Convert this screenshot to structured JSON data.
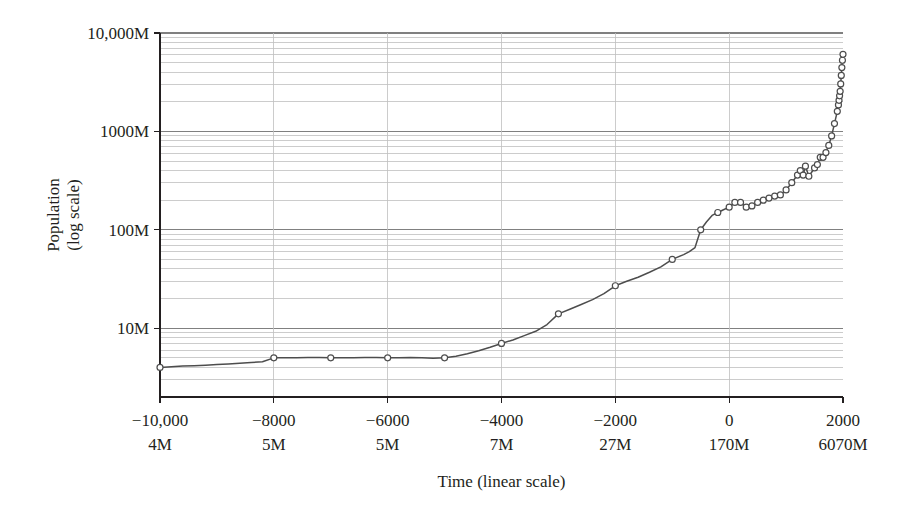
{
  "chart_data": {
    "type": "line",
    "title": "",
    "xlabel": "Time (linear scale)",
    "ylabel_line1": "Population",
    "ylabel_line2": "(log scale)",
    "xlim": [
      -10000,
      2000
    ],
    "ylim": [
      2000000,
      10000000000
    ],
    "yscale": "log",
    "xscale": "linear",
    "grid": true,
    "legend": "none",
    "y_major_ticks": [
      {
        "value": 10000000000,
        "label": "10,000M"
      },
      {
        "value": 1000000000,
        "label": "1000M"
      },
      {
        "value": 100000000,
        "label": "100M"
      },
      {
        "value": 10000000,
        "label": "10M"
      }
    ],
    "y_minor_multipliers": [
      2,
      3,
      4,
      5,
      6,
      7,
      8,
      9
    ],
    "x_major_ticks": [
      {
        "value": -10000,
        "label": "−10,000",
        "population_label": "4M"
      },
      {
        "value": -8000,
        "label": "−8000",
        "population_label": "5M"
      },
      {
        "value": -6000,
        "label": "−6000",
        "population_label": "5M"
      },
      {
        "value": -4000,
        "label": "−4000",
        "population_label": "7M"
      },
      {
        "value": -2000,
        "label": "−2000",
        "population_label": "27M"
      },
      {
        "value": 0,
        "label": "0",
        "population_label": "170M"
      },
      {
        "value": 2000,
        "label": "2000",
        "population_label": "6070M"
      }
    ],
    "series": [
      {
        "name": "World population",
        "marker": "circle",
        "line_color": "#4d4d4d",
        "marker_edge_color": "#4d4d4d",
        "marker_face_color": "#ffffff",
        "points": [
          {
            "x": -10000,
            "y": 4000000,
            "marker": true
          },
          {
            "x": -9800,
            "y": 4060000,
            "marker": false
          },
          {
            "x": -9600,
            "y": 4120000,
            "marker": false
          },
          {
            "x": -9400,
            "y": 4160000,
            "marker": false
          },
          {
            "x": -9200,
            "y": 4210000,
            "marker": false
          },
          {
            "x": -9000,
            "y": 4280000,
            "marker": false
          },
          {
            "x": -8800,
            "y": 4340000,
            "marker": false
          },
          {
            "x": -8600,
            "y": 4400000,
            "marker": false
          },
          {
            "x": -8400,
            "y": 4480000,
            "marker": false
          },
          {
            "x": -8200,
            "y": 4560000,
            "marker": false
          },
          {
            "x": -8000,
            "y": 5000000,
            "marker": true
          },
          {
            "x": -7800,
            "y": 5010000,
            "marker": false
          },
          {
            "x": -7600,
            "y": 5020000,
            "marker": false
          },
          {
            "x": -7400,
            "y": 5030000,
            "marker": false
          },
          {
            "x": -7200,
            "y": 5030000,
            "marker": false
          },
          {
            "x": -7000,
            "y": 5000000,
            "marker": true
          },
          {
            "x": -6800,
            "y": 5010000,
            "marker": false
          },
          {
            "x": -6600,
            "y": 5020000,
            "marker": false
          },
          {
            "x": -6400,
            "y": 5030000,
            "marker": false
          },
          {
            "x": -6200,
            "y": 5030000,
            "marker": false
          },
          {
            "x": -6000,
            "y": 5000000,
            "marker": true
          },
          {
            "x": -5800,
            "y": 5020000,
            "marker": false
          },
          {
            "x": -5600,
            "y": 5030000,
            "marker": false
          },
          {
            "x": -5400,
            "y": 5010000,
            "marker": false
          },
          {
            "x": -5200,
            "y": 4940000,
            "marker": false
          },
          {
            "x": -5000,
            "y": 5000000,
            "marker": true
          },
          {
            "x": -4800,
            "y": 5200000,
            "marker": false
          },
          {
            "x": -4600,
            "y": 5500000,
            "marker": false
          },
          {
            "x": -4400,
            "y": 5900000,
            "marker": false
          },
          {
            "x": -4200,
            "y": 6400000,
            "marker": false
          },
          {
            "x": -4000,
            "y": 7000000,
            "marker": true
          },
          {
            "x": -3800,
            "y": 7600000,
            "marker": false
          },
          {
            "x": -3600,
            "y": 8400000,
            "marker": false
          },
          {
            "x": -3400,
            "y": 9300000,
            "marker": false
          },
          {
            "x": -3200,
            "y": 10900000,
            "marker": false
          },
          {
            "x": -3000,
            "y": 14000000,
            "marker": true
          },
          {
            "x": -2800,
            "y": 15600000,
            "marker": false
          },
          {
            "x": -2600,
            "y": 17400000,
            "marker": false
          },
          {
            "x": -2400,
            "y": 19500000,
            "marker": false
          },
          {
            "x": -2200,
            "y": 22500000,
            "marker": false
          },
          {
            "x": -2000,
            "y": 27000000,
            "marker": true
          },
          {
            "x": -1800,
            "y": 30000000,
            "marker": false
          },
          {
            "x": -1600,
            "y": 33000000,
            "marker": false
          },
          {
            "x": -1400,
            "y": 37000000,
            "marker": false
          },
          {
            "x": -1200,
            "y": 42000000,
            "marker": false
          },
          {
            "x": -1000,
            "y": 50000000,
            "marker": true
          },
          {
            "x": -800,
            "y": 56000000,
            "marker": false
          },
          {
            "x": -700,
            "y": 60000000,
            "marker": false
          },
          {
            "x": -600,
            "y": 66000000,
            "marker": false
          },
          {
            "x": -500,
            "y": 100000000,
            "marker": true
          },
          {
            "x": -400,
            "y": 120000000,
            "marker": false
          },
          {
            "x": -300,
            "y": 140000000,
            "marker": false
          },
          {
            "x": -200,
            "y": 150000000,
            "marker": true
          },
          {
            "x": -100,
            "y": 160000000,
            "marker": false
          },
          {
            "x": 0,
            "y": 170000000,
            "marker": true
          },
          {
            "x": 100,
            "y": 190000000,
            "marker": true
          },
          {
            "x": 200,
            "y": 190000000,
            "marker": true
          },
          {
            "x": 300,
            "y": 170000000,
            "marker": true
          },
          {
            "x": 400,
            "y": 175000000,
            "marker": true
          },
          {
            "x": 500,
            "y": 190000000,
            "marker": true
          },
          {
            "x": 600,
            "y": 200000000,
            "marker": true
          },
          {
            "x": 700,
            "y": 210000000,
            "marker": true
          },
          {
            "x": 800,
            "y": 220000000,
            "marker": true
          },
          {
            "x": 900,
            "y": 226000000,
            "marker": true
          },
          {
            "x": 1000,
            "y": 254000000,
            "marker": true
          },
          {
            "x": 1100,
            "y": 301000000,
            "marker": true
          },
          {
            "x": 1200,
            "y": 360000000,
            "marker": true
          },
          {
            "x": 1250,
            "y": 400000000,
            "marker": true
          },
          {
            "x": 1300,
            "y": 360000000,
            "marker": true
          },
          {
            "x": 1340,
            "y": 443000000,
            "marker": true
          },
          {
            "x": 1400,
            "y": 350000000,
            "marker": true
          },
          {
            "x": 1500,
            "y": 425000000,
            "marker": true
          },
          {
            "x": 1550,
            "y": 460000000,
            "marker": true
          },
          {
            "x": 1600,
            "y": 545000000,
            "marker": true
          },
          {
            "x": 1650,
            "y": 545000000,
            "marker": true
          },
          {
            "x": 1700,
            "y": 610000000,
            "marker": true
          },
          {
            "x": 1750,
            "y": 720000000,
            "marker": true
          },
          {
            "x": 1800,
            "y": 900000000,
            "marker": true
          },
          {
            "x": 1850,
            "y": 1200000000,
            "marker": true
          },
          {
            "x": 1900,
            "y": 1600000000,
            "marker": true
          },
          {
            "x": 1920,
            "y": 1860000000,
            "marker": true
          },
          {
            "x": 1930,
            "y": 2070000000,
            "marker": true
          },
          {
            "x": 1940,
            "y": 2300000000,
            "marker": true
          },
          {
            "x": 1950,
            "y": 2556000000,
            "marker": true
          },
          {
            "x": 1960,
            "y": 3039000000,
            "marker": true
          },
          {
            "x": 1970,
            "y": 3707000000,
            "marker": true
          },
          {
            "x": 1980,
            "y": 4458000000,
            "marker": true
          },
          {
            "x": 1990,
            "y": 5284000000,
            "marker": true
          },
          {
            "x": 2000,
            "y": 6070000000,
            "marker": true
          }
        ]
      }
    ]
  },
  "style": {
    "background": "#ffffff",
    "axis_color": "#231f20",
    "grid_color": "#bfbfbf",
    "text_color": "#231f20"
  }
}
